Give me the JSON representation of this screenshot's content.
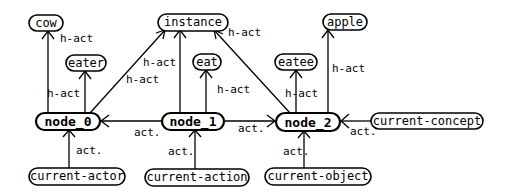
{
  "diagram": {
    "type": "semantic-network",
    "nodes": [
      {
        "id": "cow",
        "label": "cow",
        "x": 45,
        "y": 23,
        "w": 34,
        "bold": false
      },
      {
        "id": "eater",
        "label": "eater",
        "x": 86,
        "y": 63,
        "w": 40,
        "bold": false
      },
      {
        "id": "instance",
        "label": "instance",
        "x": 181,
        "y": 22,
        "w": 68,
        "bold": false
      },
      {
        "id": "eat",
        "label": "eat",
        "x": 209,
        "y": 62,
        "w": 28,
        "bold": false
      },
      {
        "id": "eatee",
        "label": "eatee",
        "x": 295,
        "y": 62,
        "w": 40,
        "bold": false
      },
      {
        "id": "apple",
        "label": "apple",
        "x": 345,
        "y": 22,
        "w": 44,
        "bold": false
      },
      {
        "id": "node_0",
        "label": "node_0",
        "x": 68,
        "y": 121,
        "w": 64,
        "bold": true
      },
      {
        "id": "node_1",
        "label": "node_1",
        "x": 193,
        "y": 121,
        "w": 62,
        "bold": true
      },
      {
        "id": "node_2",
        "label": "node_2",
        "x": 308,
        "y": 122,
        "w": 64,
        "bold": true
      },
      {
        "id": "current-concept",
        "label": "current-concept",
        "x": 427,
        "y": 121,
        "w": 112,
        "bold": false
      },
      {
        "id": "current-actor",
        "label": "current-actor",
        "x": 68,
        "y": 176,
        "w": 96,
        "bold": false
      },
      {
        "id": "current-action",
        "label": "current-action",
        "x": 192,
        "y": 177,
        "w": 100,
        "bold": false
      },
      {
        "id": "current-object",
        "label": "current-object",
        "x": 320,
        "y": 176,
        "w": 100,
        "bold": false
      }
    ],
    "edges": [
      {
        "from": "node_0",
        "to": "cow",
        "label": "h-act",
        "lx": 60,
        "ly": 42
      },
      {
        "from": "node_0",
        "to": "eater",
        "label": "h-act",
        "lx": 47,
        "ly": 97
      },
      {
        "from": "node_0",
        "to": "instance",
        "label": "h-act",
        "lx": 126,
        "ly": 83
      },
      {
        "from": "node_1",
        "to": "instance",
        "label": "h-act",
        "lx": 143,
        "ly": 66
      },
      {
        "from": "node_1",
        "to": "eat",
        "label": "h-act",
        "lx": 217,
        "ly": 93
      },
      {
        "from": "node_2",
        "to": "instance",
        "label": "h-act",
        "lx": 228,
        "ly": 36
      },
      {
        "from": "node_2",
        "to": "eatee",
        "label": "h-act",
        "lx": 285,
        "ly": 97
      },
      {
        "from": "node_2",
        "to": "apple",
        "label": "h-act",
        "lx": 332,
        "ly": 72
      },
      {
        "from": "node_1",
        "to": "node_0",
        "label": "act.",
        "lx": 134,
        "ly": 136
      },
      {
        "from": "node_1",
        "to": "node_2",
        "label": "act.",
        "lx": 238,
        "ly": 132
      },
      {
        "from": "current-concept",
        "to": "node_2",
        "label": "act.",
        "lx": 350,
        "ly": 135
      },
      {
        "from": "current-actor",
        "to": "node_0",
        "label": "act.",
        "lx": 76,
        "ly": 154
      },
      {
        "from": "current-action",
        "to": "node_1",
        "label": "act.",
        "lx": 168,
        "ly": 155
      },
      {
        "from": "current-object",
        "to": "node_2",
        "label": "act.",
        "lx": 283,
        "ly": 155
      }
    ]
  }
}
